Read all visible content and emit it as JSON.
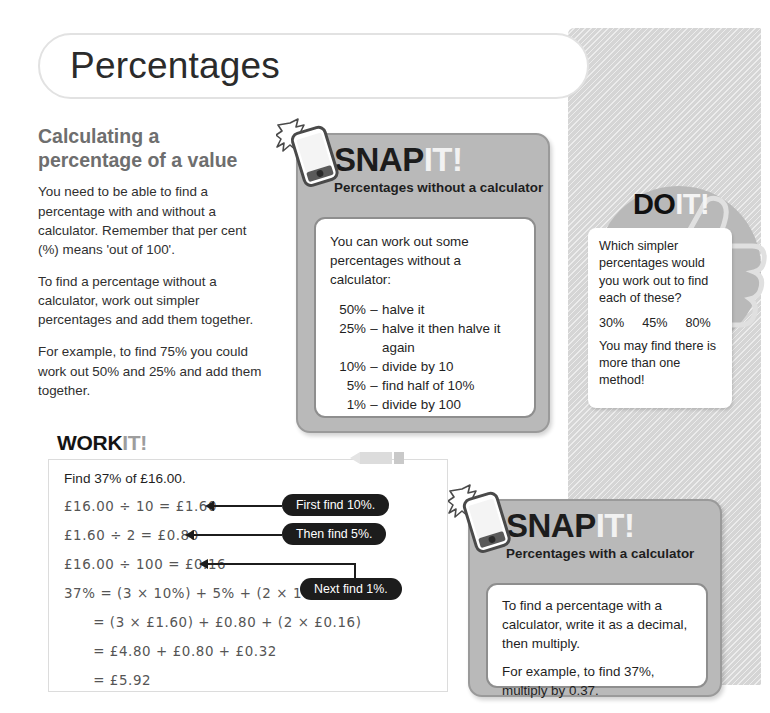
{
  "page": {
    "title": "Percentages"
  },
  "left_column": {
    "heading": "Calculating a percentage of a value",
    "paragraphs": [
      "You need to be able to find a percentage with and without a calculator. Remember that per cent (%) means 'out of 100'.",
      "To find a percentage without a calculator, work out simpler percentages and add them together.",
      "For example, to find 75%  you could work out 50% and 25% and add them together."
    ]
  },
  "snap_box_1": {
    "title_main": "SNAP",
    "title_suffix": "IT!",
    "subtitle": "Percentages without a calculator",
    "intro": "You can work out some percentages without a calculator:",
    "rules": [
      {
        "percent": "50%",
        "dash": "–",
        "text": "halve it"
      },
      {
        "percent": "25%",
        "dash": "–",
        "text": "halve it then halve it again"
      },
      {
        "percent": "10%",
        "dash": "–",
        "text": "divide by 10"
      },
      {
        "percent": "5%",
        "dash": "–",
        "text": "find half of 10%"
      },
      {
        "percent": "1%",
        "dash": "–",
        "text": "divide by 100"
      }
    ],
    "icon": "smartphone-camera-icon"
  },
  "do_it_box": {
    "title_main": "DO",
    "title_suffix": "IT!",
    "question": "Which simpler percentages would you work out to find each of these?",
    "percentages": [
      "30%",
      "45%",
      "80%"
    ],
    "note": "You may find there is more than one method!",
    "icon": "thumbs-up-icon"
  },
  "work_it": {
    "title_main": "WORK",
    "title_suffix": "IT!",
    "icon": "pencil-icon",
    "prompt": "Find 37% of £16.00.",
    "working": [
      "£16.00 ÷ 10 = £1.60",
      "£1.60 ÷ 2 = £0.80",
      "£16.00 ÷ 100 = £0.16",
      "37% = (3 × 10%) + 5% + (2 × 1%)",
      "      = (3 × £1.60) + £0.80 + (2 × £0.16)",
      "      = £4.80 + £0.80 + £0.32",
      "      = £5.92"
    ],
    "callouts": [
      "First find 10%.",
      "Then find 5%.",
      "Next find 1%."
    ]
  },
  "snap_box_2": {
    "title_main": "SNAP",
    "title_suffix": "IT!",
    "subtitle": "Percentages with a calculator",
    "paragraphs": [
      "To find a percentage with a calculator, write it as a decimal, then multiply.",
      "For example, to find 37%, multiply by 0.37."
    ],
    "icon": "smartphone-camera-icon"
  },
  "colors": {
    "panel_gray": "#d5d5d5",
    "snap_gray": "#b9b9b9",
    "heading_gray": "#6e6e6e",
    "callout_black": "#1c1c1c",
    "handwriting_gray": "#555555"
  }
}
